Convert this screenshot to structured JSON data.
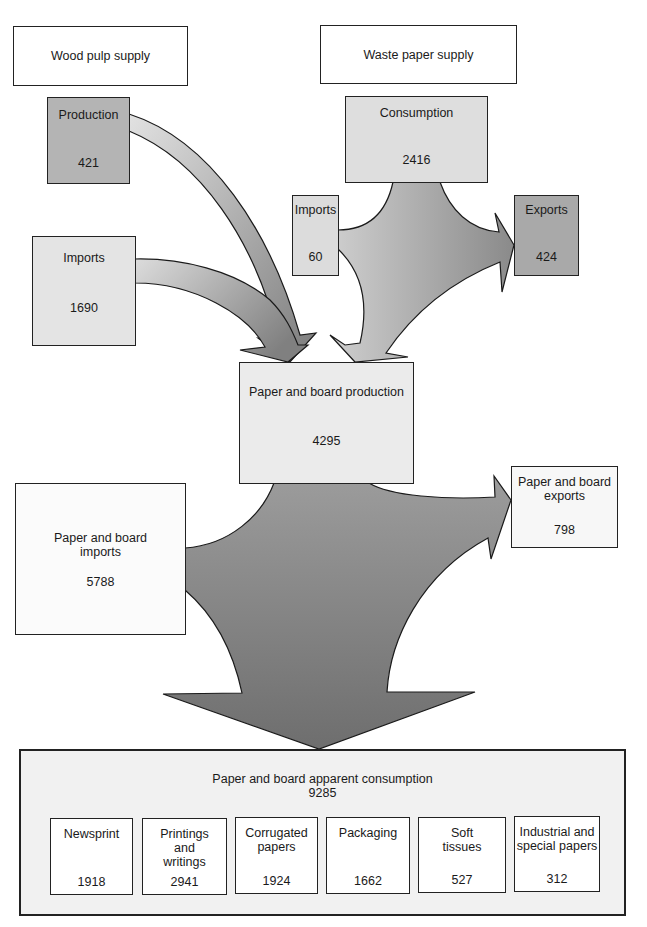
{
  "diagram": {
    "type": "flow",
    "colors": {
      "flow_light": "#d8d8d8",
      "flow_dark": "#7a7a7a",
      "box_dark": "#a8a8a8",
      "box_light": "#ececec",
      "outline": "#222222"
    },
    "headers": {
      "wood_pulp": "Wood pulp supply",
      "waste_paper": "Waste paper supply"
    },
    "wood_pulp": {
      "production": {
        "label": "Production",
        "value": "421"
      },
      "imports": {
        "label": "Imports",
        "value": "1690"
      }
    },
    "waste_paper": {
      "consumption": {
        "label": "Consumption",
        "value": "2416"
      },
      "imports": {
        "label": "Imports",
        "value": "60"
      },
      "exports": {
        "label": "Exports",
        "value": "424"
      }
    },
    "paper_board": {
      "production": {
        "label": "Paper and board production",
        "value": "4295"
      },
      "exports": {
        "label_line1": "Paper and board",
        "label_line2": "exports",
        "value": "798"
      },
      "imports": {
        "label_line1": "Paper and board",
        "label_line2": "imports",
        "value": "5788"
      }
    },
    "apparent_consumption": {
      "label": "Paper and board apparent consumption",
      "value": "9285",
      "categories": [
        {
          "lines": [
            "Newsprint"
          ],
          "value": "1918"
        },
        {
          "lines": [
            "Printings",
            "and",
            "writings"
          ],
          "value": "2941"
        },
        {
          "lines": [
            "Corrugated",
            "papers"
          ],
          "value": "1924"
        },
        {
          "lines": [
            "Packaging"
          ],
          "value": "1662"
        },
        {
          "lines": [
            "Soft",
            "tissues"
          ],
          "value": "527"
        },
        {
          "lines": [
            "Industrial and",
            "special papers"
          ],
          "value": "312"
        }
      ]
    }
  }
}
